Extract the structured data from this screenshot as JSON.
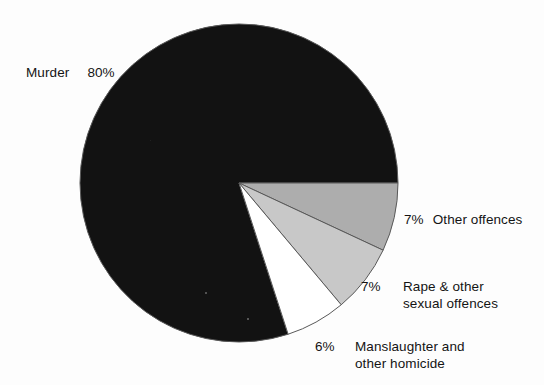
{
  "chart_data": {
    "type": "pie",
    "title": "",
    "subtitle": "",
    "xlabel": "",
    "ylabel": "",
    "legend_position": "none",
    "grid": false,
    "categories": [
      "Murder",
      "Other offences",
      "Rape & other sexual offences",
      "Manslaughter and other homicide"
    ],
    "values": [
      80,
      7,
      7,
      6
    ],
    "value_labels": [
      "80%",
      "7%",
      "7%",
      "6%"
    ],
    "units": "percent",
    "slices": [
      {
        "label": "Murder",
        "value": 80,
        "value_label": "80%",
        "color": "#121212",
        "start_angle_deg": 72,
        "end_angle_deg": 360
      },
      {
        "label": "Other offences",
        "value": 7,
        "value_label": "7%",
        "color": "#adadad",
        "start_angle_deg": 0,
        "end_angle_deg": 25
      },
      {
        "label": "Rape & other sexual offences",
        "value": 7,
        "value_label": "7%",
        "color": "#c8c8c8",
        "start_angle_deg": 25,
        "end_angle_deg": 50
      },
      {
        "label": "Manslaughter and other homicide",
        "value": 6,
        "value_label": "6%",
        "color": "#ffffff",
        "start_angle_deg": 50,
        "end_angle_deg": 72
      }
    ]
  },
  "labels": {
    "murder": {
      "name": "Murder",
      "percent": "80%"
    },
    "other_offences": {
      "name": "Other offences",
      "percent": "7%"
    },
    "rape_sexual": {
      "line1": "Rape & other",
      "line2": "sexual offences",
      "percent": "7%"
    },
    "manslaughter": {
      "line1": "Manslaughter and",
      "line2": "other homicide",
      "percent": "6%"
    }
  },
  "colors": {
    "background": "#fdfdfd",
    "murder_slice": "#121212",
    "other_offences_slice": "#adadad",
    "rape_sexual_slice": "#c8c8c8",
    "manslaughter_slice": "#ffffff",
    "slice_outline": "#595959",
    "text": "#141414"
  },
  "geometry": {
    "center_x": 239,
    "center_y": 183,
    "radius": 159
  }
}
